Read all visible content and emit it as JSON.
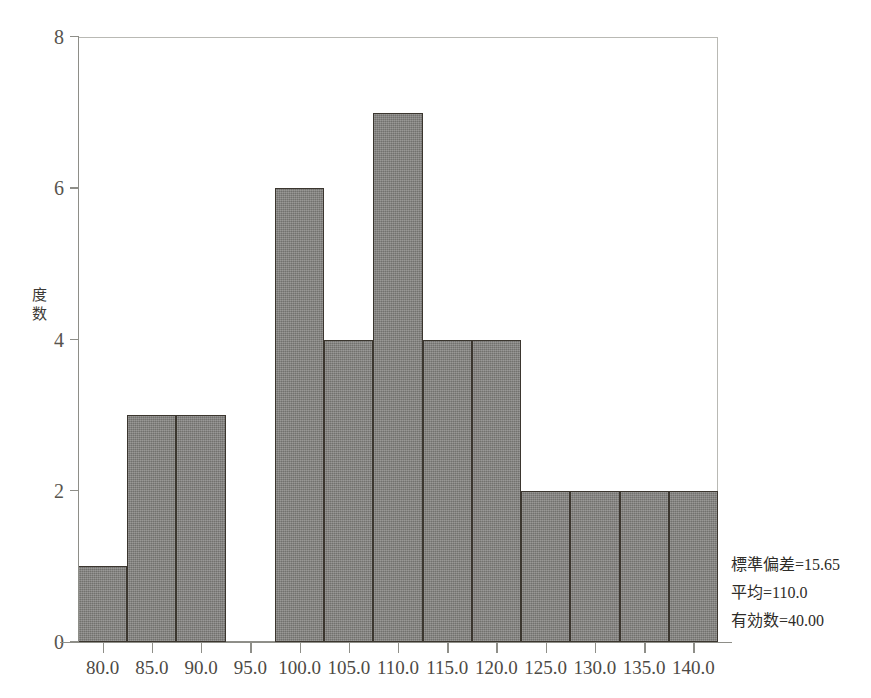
{
  "chart_data": {
    "type": "bar",
    "title": "",
    "subtitle": "",
    "xlabel": "",
    "ylabel": "度数",
    "categories": [
      "80.0",
      "85.0",
      "90.0",
      "95.0",
      "100.0",
      "105.0",
      "110.0",
      "115.0",
      "120.0",
      "125.0",
      "130.0",
      "135.0",
      "140.0"
    ],
    "values": [
      1,
      3,
      3,
      0,
      6,
      4,
      7,
      4,
      4,
      2,
      2,
      2,
      2
    ],
    "ylim": [
      0,
      8
    ],
    "yticks": [
      0,
      2,
      4,
      6,
      8
    ],
    "ytick_labels": [
      "0",
      "2",
      "4",
      "6",
      "8"
    ],
    "xtick_labels": [
      "80.0",
      "85.0",
      "90.0",
      "95.0",
      "100.0",
      "105.0",
      "110.0",
      "115.0",
      "120.0",
      "125.0",
      "130.0",
      "135.0",
      "140.0"
    ],
    "grid": false,
    "legend": false,
    "bin_width": 5,
    "bar_fill_color": "#7d7c79",
    "bar_border_color": "#3b362f",
    "axis_color": "#8e8e88",
    "background_color": "#ffffff",
    "annotations": [
      "標準偏差=15.65",
      "平均=110.0",
      "有効数=40.00"
    ]
  },
  "axes": {
    "y_title_chars": [
      "度",
      "数"
    ],
    "y_ticks": [
      {
        "label": "8",
        "value": 8
      },
      {
        "label": "6",
        "value": 6
      },
      {
        "label": "4",
        "value": 4
      },
      {
        "label": "2",
        "value": 2
      },
      {
        "label": "0",
        "value": 0
      }
    ]
  },
  "stats": {
    "std_dev": "標準偏差=15.65",
    "mean": "平均=110.0",
    "valid_n": "有効数=40.00"
  }
}
